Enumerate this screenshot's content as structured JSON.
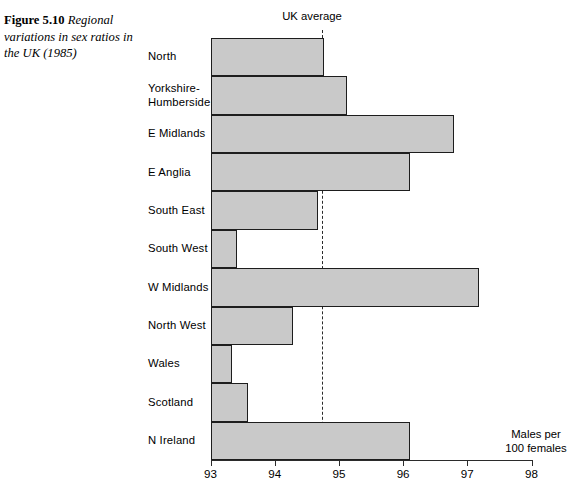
{
  "caption": {
    "figure_number": "Figure 5.10",
    "text": " Regional variations in sex ratios in the UK (1985)"
  },
  "annotations": {
    "uk_average_label": "UK average"
  },
  "axis": {
    "title_line1": "Males per",
    "title_line2": "100 females"
  },
  "chart_data": {
    "type": "bar",
    "orientation": "horizontal",
    "title": "Regional variations in sex ratios in the UK (1985)",
    "xlabel": "Males per 100 females",
    "ylabel": "",
    "xlim": [
      93,
      98
    ],
    "xticks": [
      93,
      94,
      95,
      96,
      97,
      98
    ],
    "xtick_labels": [
      "93",
      "94",
      "95",
      "96",
      "97",
      "98"
    ],
    "grid": false,
    "legend": null,
    "bar_color": "#c9c9c9",
    "bar_edge_color": "#1d1d1d",
    "reference_line": {
      "label": "UK average",
      "value": 94.74,
      "style": "dashed",
      "color": "#2a2a2a"
    },
    "categories": [
      "North",
      "Yorkshire-\nHumberside",
      "E Midlands",
      "E Anglia",
      "South East",
      "South West",
      "W Midlands",
      "North West",
      "Wales",
      "Scotland",
      "N Ireland"
    ],
    "values": [
      94.77,
      95.12,
      96.79,
      96.11,
      94.68,
      93.42,
      97.18,
      94.28,
      93.34,
      93.58,
      96.11
    ]
  }
}
